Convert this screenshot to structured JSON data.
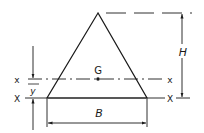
{
  "diagram": {
    "labels": {
      "centroid": "G",
      "height": "H",
      "base": "B",
      "centroid_axis_left": "x",
      "centroid_axis_right": "x",
      "base_axis_left": "X",
      "base_axis_right": "X",
      "centroid_distance": "y"
    },
    "colors": {
      "stroke": "#1a1a1a",
      "background": "#ffffff"
    }
  }
}
